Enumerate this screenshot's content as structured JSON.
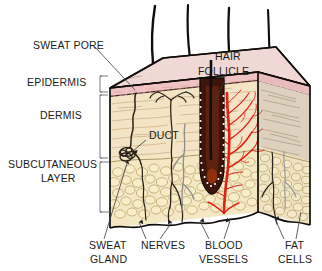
{
  "diagram": {
    "colors": {
      "epidermis_top": "#f0d9d4",
      "epidermis_front": "#eec3c2",
      "epidermis_band": "#e3a9a8",
      "dermis_front": "#f1e2c4",
      "dermis_side": "#d9cdbb",
      "fat_front": "#f2e6c2",
      "fat_cell_outline": "#b79a5e",
      "blood_vessel": "#e02015",
      "follicle": "#44160c",
      "hair": "#100d0a",
      "nerve": "#9a9a9a",
      "duct": "#2b2217",
      "outline": "#100d0a",
      "text": "#1b1b1b",
      "leader": "#3a3a3a",
      "background": "#ffffff"
    }
  },
  "labels": {
    "left": [
      {
        "id": "sweat-pore",
        "text": "SWEAT PORE",
        "x": 33,
        "y": 49
      },
      {
        "id": "epidermis",
        "text": "EPIDERMIS",
        "x": 27,
        "y": 86
      },
      {
        "id": "dermis",
        "text": "DERMIS",
        "x": 40,
        "y": 119
      },
      {
        "id": "subcutaneous-line1",
        "text": "SUBCUTANEOUS",
        "x": 8,
        "y": 168
      },
      {
        "id": "subcutaneous-line2",
        "text": "LAYER",
        "x": 41,
        "y": 182
      }
    ],
    "inner": [
      {
        "id": "duct",
        "text": "DUCT",
        "x": 149,
        "y": 139
      },
      {
        "id": "hair-follicle-line1",
        "text": "HAIR",
        "x": 215,
        "y": 60
      },
      {
        "id": "hair-follicle-line2",
        "text": "FOLLICLE",
        "x": 198,
        "y": 75
      }
    ],
    "bottom": [
      {
        "id": "sweat-gland-line1",
        "text": "SWEAT",
        "x": 89,
        "y": 249
      },
      {
        "id": "sweat-gland-line2",
        "text": "GLAND",
        "x": 90,
        "y": 263
      },
      {
        "id": "nerves",
        "text": "NERVES",
        "x": 141,
        "y": 249
      },
      {
        "id": "blood-vessels-line1",
        "text": "BLOOD",
        "x": 205,
        "y": 249
      },
      {
        "id": "blood-vessels-line2",
        "text": "VESSELS",
        "x": 199,
        "y": 263
      },
      {
        "id": "fat-cells-line1",
        "text": "FAT",
        "x": 285,
        "y": 249
      },
      {
        "id": "fat-cells-line2",
        "text": "CELLS",
        "x": 278,
        "y": 263
      }
    ]
  },
  "layer_names": {
    "epidermis": "Epidermis",
    "dermis": "Dermis",
    "subcutaneous": "Subcutaneous layer"
  },
  "structures": {
    "hair_count": 4,
    "follicle_label": "hair follicle",
    "sweat_gland_label": "sweat gland coil",
    "blood_vessel_label": "blood vessel tree",
    "nerve_label": "nerve fibers",
    "fat_label": "fat cells"
  }
}
